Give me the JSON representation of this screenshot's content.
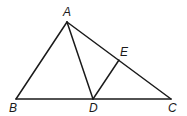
{
  "diagram": {
    "type": "triangle-construction",
    "points": [
      {
        "name": "A",
        "x": 67,
        "y": 22,
        "label_x": 64,
        "label_y": 16
      },
      {
        "name": "B",
        "x": 16,
        "y": 99,
        "label_x": 10,
        "label_y": 112
      },
      {
        "name": "C",
        "x": 171,
        "y": 99,
        "label_x": 168,
        "label_y": 112
      },
      {
        "name": "D",
        "x": 93,
        "y": 99,
        "label_x": 89,
        "label_y": 112
      },
      {
        "name": "E",
        "x": 119,
        "y": 60,
        "label_x": 120,
        "label_y": 56
      }
    ],
    "segments": [
      {
        "from": "A",
        "to": "B"
      },
      {
        "from": "A",
        "to": "C"
      },
      {
        "from": "B",
        "to": "C"
      },
      {
        "from": "A",
        "to": "D"
      },
      {
        "from": "D",
        "to": "E"
      }
    ],
    "labels": {
      "A": "A",
      "B": "B",
      "C": "C",
      "D": "D",
      "E": "E"
    },
    "stroke_color": "#1a1a1a",
    "background": "#ffffff"
  }
}
